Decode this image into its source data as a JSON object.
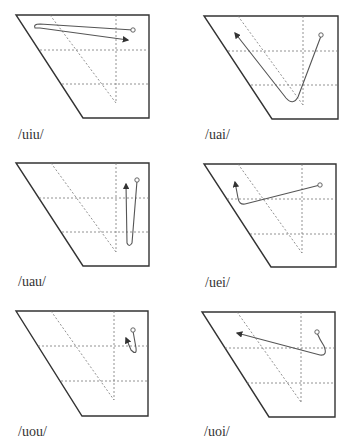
{
  "figure": {
    "panels": [
      {
        "id": "uiu",
        "label": "/uiu/"
      },
      {
        "id": "uai",
        "label": "/uai/"
      },
      {
        "id": "uau",
        "label": "/uau/"
      },
      {
        "id": "uei",
        "label": "/uei/"
      },
      {
        "id": "uou",
        "label": "/uou/"
      },
      {
        "id": "uoi",
        "label": "/uoi/"
      }
    ],
    "colors": {
      "outline": "#333333",
      "guide": "#777777",
      "trajectory": "#555555"
    }
  }
}
